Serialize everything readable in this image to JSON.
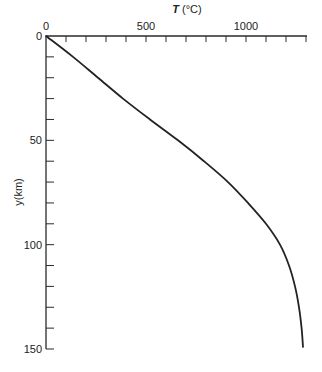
{
  "chart_data": {
    "type": "line",
    "title": "",
    "xlabel": "T (°C)",
    "xlabel_var": "T",
    "xlabel_unit": " (°C)",
    "ylabel": "y(km)",
    "xlim": [
      0,
      1300
    ],
    "ylim": [
      150,
      0
    ],
    "x_axis_position": "top",
    "y_inverted": true,
    "grid": false,
    "legend": null,
    "x_ticks_major": [
      0,
      500,
      1000
    ],
    "x_tick_labels": [
      "0",
      "500",
      "1000"
    ],
    "x_ticks_minor_step": 100,
    "y_ticks_major": [
      0,
      50,
      100,
      150
    ],
    "y_tick_labels": [
      "0",
      "50",
      "100",
      "150"
    ],
    "y_ticks_minor_step": 10,
    "series": [
      {
        "name": "geotherm",
        "color": "#222222",
        "points": [
          {
            "T": 0,
            "y": 0
          },
          {
            "T": 135,
            "y": 10
          },
          {
            "T": 260,
            "y": 20
          },
          {
            "T": 385,
            "y": 30
          },
          {
            "T": 520,
            "y": 40
          },
          {
            "T": 660,
            "y": 50
          },
          {
            "T": 790,
            "y": 60
          },
          {
            "T": 910,
            "y": 70
          },
          {
            "T": 1010,
            "y": 80
          },
          {
            "T": 1100,
            "y": 90
          },
          {
            "T": 1170,
            "y": 100
          },
          {
            "T": 1215,
            "y": 110
          },
          {
            "T": 1245,
            "y": 120
          },
          {
            "T": 1265,
            "y": 130
          },
          {
            "T": 1278,
            "y": 140
          },
          {
            "T": 1285,
            "y": 149
          }
        ]
      }
    ]
  }
}
